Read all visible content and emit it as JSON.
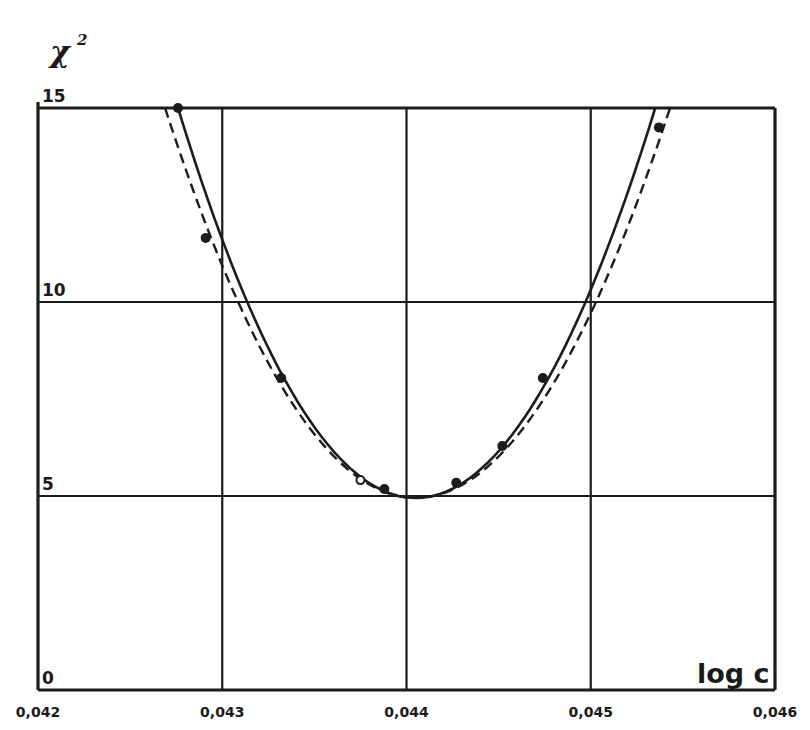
{
  "chart_data": {
    "type": "line",
    "title": "",
    "xlabel": "log c",
    "ylabel": "χ²",
    "xlim": [
      0.042,
      0.046
    ],
    "ylim": [
      0,
      15
    ],
    "grid": true,
    "legend": null,
    "x_ticks": [
      "0,042",
      "0,043",
      "0,044",
      "0,045",
      "0,046"
    ],
    "x_tick_values": [
      0.042,
      0.043,
      0.044,
      0.045,
      0.046
    ],
    "y_ticks": [
      "0",
      "5",
      "10",
      "15"
    ],
    "y_tick_values": [
      0,
      5,
      10,
      15
    ],
    "series": [
      {
        "name": "solid fit curve",
        "style": "solid",
        "shape": "parabola",
        "vertex": {
          "x": 0.04405,
          "y": 4.95
        },
        "points": [
          {
            "x": 0.04276,
            "y": 15.0
          },
          {
            "x": 0.043,
            "y": 11.0
          },
          {
            "x": 0.04332,
            "y": 8.0
          },
          {
            "x": 0.0437,
            "y": 5.6
          },
          {
            "x": 0.04405,
            "y": 4.95
          },
          {
            "x": 0.0444,
            "y": 5.6
          },
          {
            "x": 0.04478,
            "y": 8.0
          },
          {
            "x": 0.045,
            "y": 10.2
          },
          {
            "x": 0.04535,
            "y": 15.0
          }
        ]
      },
      {
        "name": "dashed fit curve",
        "style": "dashed",
        "shape": "parabola",
        "vertex": {
          "x": 0.04405,
          "y": 4.95
        },
        "points": [
          {
            "x": 0.04269,
            "y": 15.0
          },
          {
            "x": 0.04295,
            "y": 11.2
          },
          {
            "x": 0.04328,
            "y": 7.8
          },
          {
            "x": 0.04368,
            "y": 5.5
          },
          {
            "x": 0.04405,
            "y": 4.95
          },
          {
            "x": 0.04445,
            "y": 5.5
          },
          {
            "x": 0.04484,
            "y": 7.8
          },
          {
            "x": 0.04504,
            "y": 10.0
          },
          {
            "x": 0.04543,
            "y": 15.0
          }
        ]
      },
      {
        "name": "data points (filled)",
        "style": "markers",
        "marker": "filled-circle",
        "points": [
          {
            "x": 0.04276,
            "y": 15.0
          },
          {
            "x": 0.04291,
            "y": 11.65
          },
          {
            "x": 0.04332,
            "y": 8.04
          },
          {
            "x": 0.04388,
            "y": 5.18
          },
          {
            "x": 0.04427,
            "y": 5.34
          },
          {
            "x": 0.04452,
            "y": 6.29
          },
          {
            "x": 0.04474,
            "y": 8.04
          },
          {
            "x": 0.04537,
            "y": 14.5
          }
        ]
      },
      {
        "name": "data point (open)",
        "style": "markers",
        "marker": "open-circle",
        "points": [
          {
            "x": 0.04375,
            "y": 5.41
          }
        ]
      }
    ]
  },
  "labels": {
    "y_axis": "χ",
    "y_axis_sup": "2",
    "x_axis": "log c"
  }
}
